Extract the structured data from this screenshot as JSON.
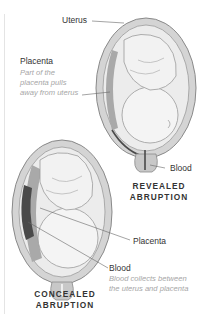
{
  "labels": {
    "uterus": "Uterus",
    "placenta_top": "Placenta",
    "placenta_top_desc_1": "Part of the",
    "placenta_top_desc_2": "placenta pulls",
    "placenta_top_desc_3": "away from uterus",
    "blood_top": "Blood",
    "placenta_bottom": "Placenta",
    "blood_bottom": "Blood",
    "blood_bottom_desc_1": "Blood collects between",
    "blood_bottom_desc_2": "the uterus and placenta"
  },
  "titles": {
    "revealed_1": "REVEALED",
    "revealed_2": "ABRUPTION",
    "concealed_1": "CONCEALED",
    "concealed_2": "ABRUPTION"
  },
  "colors": {
    "outline": "#8a8a8a",
    "uterus_wall": "#d0d0d0",
    "inner": "#ececec",
    "placenta": "#a9a9a9",
    "blood": "#4a4a4a"
  }
}
